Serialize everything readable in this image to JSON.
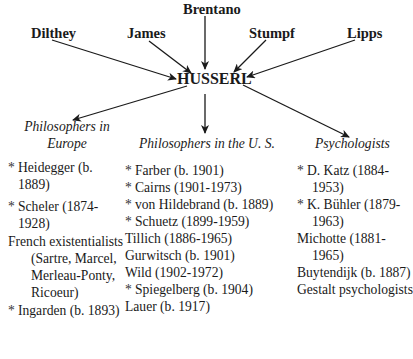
{
  "influences": [
    {
      "name": "Brentano"
    },
    {
      "name": "Dilthey"
    },
    {
      "name": "James"
    },
    {
      "name": "Stumpf"
    },
    {
      "name": "Lipps"
    }
  ],
  "center": {
    "name": "HUSSERL"
  },
  "groups": [
    {
      "title_line1": "Philosophers in",
      "title_line2": "Europe",
      "items": [
        {
          "star": "*",
          "text": "Heidegger (b. 1889)"
        },
        {
          "star": "*",
          "text": "Scheler (1874-1928)"
        },
        {
          "star": "",
          "text": "French existentialists (Sartre, Marcel, Merleau-Ponty, Ricoeur)"
        },
        {
          "star": "*",
          "text": "Ingarden (b. 1893)"
        }
      ]
    },
    {
      "title_line1": "Philosophers in the U. S.",
      "items": [
        {
          "star": "*",
          "text": "Farber (b. 1901)"
        },
        {
          "star": "*",
          "text": "Cairns (1901-1973)"
        },
        {
          "star": "*",
          "text": "von Hildebrand (b. 1889)"
        },
        {
          "star": "*",
          "text": "Schuetz (1899-1959)"
        },
        {
          "star": "",
          "text": "Tillich (1886-1965)"
        },
        {
          "star": "",
          "text": "Gurwitsch (b. 1901)"
        },
        {
          "star": "",
          "text": "Wild (1902-1972)"
        },
        {
          "star": "*",
          "text": "Spiegelberg (b. 1904)"
        },
        {
          "star": "",
          "text": "Lauer (b. 1917)"
        }
      ]
    },
    {
      "title_line1": "Psychologists",
      "items": [
        {
          "star": "*",
          "text": "D. Katz (1884-1953)"
        },
        {
          "star": "*",
          "text": "K. Bühler (1879-1963)"
        },
        {
          "star": "",
          "text": "Michotte (1881-1965)"
        },
        {
          "star": "",
          "text": "Buytendijk (b. 1887)"
        },
        {
          "star": "",
          "text": "Gestalt psychologists"
        }
      ]
    }
  ]
}
